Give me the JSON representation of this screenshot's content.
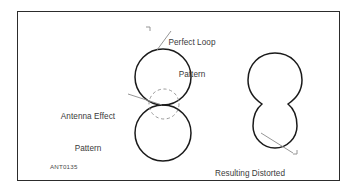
{
  "figure": {
    "id_label": "ANT0135",
    "background_color": "#ffffff",
    "frame_color": "#2c2c2c",
    "stroke_color": "#1a1a1a",
    "dashed_stroke_color": "#8a8a8a",
    "leader_color": "#808080",
    "text_color": "#3a3a3a"
  },
  "labels": {
    "perfect_loop": {
      "line1": "Perfect Loop",
      "line2": "Pattern"
    },
    "antenna_effect": {
      "line1": "Antenna Effect",
      "line2": "Pattern"
    },
    "resulting_distorted": {
      "line1": "Resulting Distorted",
      "line2": "Pattern"
    }
  },
  "shapes": {
    "perfect_loop_upper_circle": {
      "name": "upper-lobe-circle",
      "cx": 163,
      "cy": 77,
      "r": 28
    },
    "perfect_loop_lower_circle": {
      "name": "lower-lobe-circle",
      "cx": 163,
      "cy": 133,
      "r": 28
    },
    "antenna_effect_dashed_circle": {
      "name": "antenna-effect-circle",
      "cx": 164,
      "cy": 104,
      "r": 15
    },
    "distorted_upper_circle": {
      "name": "distorted-large-lobe",
      "cx": 275,
      "cy": 80,
      "r": 27
    },
    "distorted_lower_circle": {
      "name": "distorted-small-lobe",
      "cx": 275,
      "cy": 126,
      "r": 22
    }
  },
  "leaders": {
    "perfect_loop": {
      "x1": 171,
      "y1": 31,
      "x2": 157,
      "y2": 50
    },
    "antenna_effect": {
      "x1": 130,
      "y1": 95,
      "x2": 160,
      "y2": 105
    },
    "resulting_distorted": {
      "x1": 262,
      "y1": 134,
      "x2": 292,
      "y2": 154
    }
  }
}
